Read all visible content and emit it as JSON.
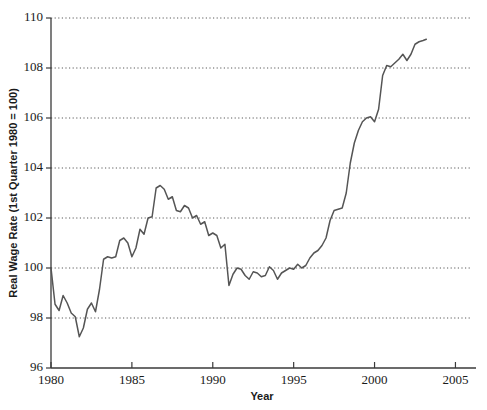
{
  "chart_data": {
    "type": "line",
    "title": "",
    "xlabel": "Year",
    "ylabel": "Real Wage Rate (1st Quarter 1980 = 100)",
    "xlim": [
      1980,
      2005.9
    ],
    "ylim": [
      96,
      110
    ],
    "xticks": [
      1980,
      1985,
      1990,
      1995,
      2000,
      2005
    ],
    "xtick_labels": [
      "1980",
      "1985",
      "1990",
      "1995",
      "2000",
      "2005"
    ],
    "yticks": [
      96,
      98,
      100,
      102,
      104,
      106,
      108,
      110
    ],
    "ytick_labels": [
      "96",
      "98",
      "100",
      "102",
      "104",
      "106",
      "108",
      "110"
    ],
    "grid": "horizontal-dotted",
    "gridlines_at": [
      98,
      100,
      102,
      104,
      106,
      108,
      110
    ],
    "legend": "none",
    "line_color": "#555555",
    "series": [
      {
        "name": "Real Wage Rate",
        "x": [
          1980.0,
          1980.25,
          1980.5,
          1980.75,
          1981.0,
          1981.25,
          1981.5,
          1981.75,
          1982.0,
          1982.25,
          1982.5,
          1982.75,
          1983.0,
          1983.25,
          1983.5,
          1983.75,
          1984.0,
          1984.25,
          1984.5,
          1984.75,
          1985.0,
          1985.25,
          1985.5,
          1985.75,
          1986.0,
          1986.25,
          1986.5,
          1986.75,
          1987.0,
          1987.25,
          1987.5,
          1987.75,
          1988.0,
          1988.25,
          1988.5,
          1988.75,
          1989.0,
          1989.25,
          1989.5,
          1989.75,
          1990.0,
          1990.25,
          1990.5,
          1990.75,
          1991.0,
          1991.25,
          1991.5,
          1991.75,
          1992.0,
          1992.25,
          1992.5,
          1992.75,
          1993.0,
          1993.25,
          1993.5,
          1993.75,
          1994.0,
          1994.25,
          1994.5,
          1994.75,
          1995.0,
          1995.25,
          1995.5,
          1995.75,
          1996.0,
          1996.25,
          1996.5,
          1996.75,
          1997.0,
          1997.25,
          1997.5,
          1997.75,
          1998.0,
          1998.25,
          1998.5,
          1998.75,
          1999.0,
          1999.25,
          1999.5,
          1999.75,
          2000.0,
          2000.25,
          2000.5,
          2000.75,
          2001.0,
          2001.25,
          2001.5,
          2001.75,
          2002.0,
          2002.25,
          2002.5,
          2002.75,
          2003.0,
          2003.2
        ],
        "y": [
          100.0,
          98.55,
          98.3,
          98.9,
          98.6,
          98.2,
          98.05,
          97.25,
          97.6,
          98.35,
          98.6,
          98.25,
          99.15,
          100.35,
          100.45,
          100.4,
          100.45,
          101.1,
          101.2,
          101.0,
          100.45,
          100.8,
          101.55,
          101.35,
          102.0,
          102.05,
          103.2,
          103.3,
          103.15,
          102.75,
          102.85,
          102.3,
          102.25,
          102.5,
          102.4,
          102.0,
          102.1,
          101.75,
          101.85,
          101.3,
          101.4,
          101.3,
          100.8,
          100.95,
          99.3,
          99.75,
          100.0,
          99.95,
          99.7,
          99.55,
          99.85,
          99.8,
          99.65,
          99.7,
          100.05,
          99.9,
          99.55,
          99.8,
          99.9,
          100.0,
          99.95,
          100.15,
          100.0,
          100.1,
          100.4,
          100.6,
          100.7,
          100.9,
          101.2,
          101.9,
          102.3,
          102.35,
          102.4,
          103.0,
          104.2,
          105.0,
          105.5,
          105.85,
          106.0,
          106.05,
          105.85,
          106.35,
          107.7,
          108.1,
          108.05,
          108.2,
          108.35,
          108.55,
          108.3,
          108.55,
          108.95,
          109.05,
          109.1,
          109.15
        ]
      }
    ]
  },
  "axis": {
    "x_title": "Year",
    "y_title": "Real Wage Rate (1st Quarter 1980 = 100)"
  }
}
